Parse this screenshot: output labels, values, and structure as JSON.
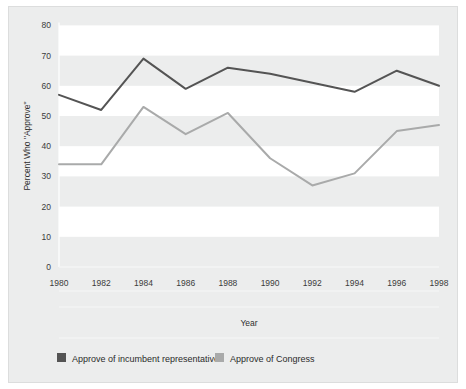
{
  "chart_data": {
    "type": "line",
    "title": "",
    "xlabel": "Year",
    "ylabel": "Percent Who \"Approve\"",
    "x": [
      1980,
      1982,
      1984,
      1986,
      1988,
      1990,
      1992,
      1994,
      1996,
      1998
    ],
    "xticklabels": [
      "1980",
      "1982",
      "1984",
      "1986",
      "1988",
      "1990",
      "1992",
      "1994",
      "1996",
      "1998"
    ],
    "yticklabels": [
      "0",
      "10",
      "20",
      "30",
      "40",
      "50",
      "60",
      "70",
      "80"
    ],
    "yticks": [
      0,
      10,
      20,
      30,
      40,
      50,
      60,
      70,
      80
    ],
    "ylim": [
      0,
      80
    ],
    "xlim": [
      1980,
      1998
    ],
    "grid": false,
    "banded_background": true,
    "legend_position": "bottom",
    "series": [
      {
        "name": "Approve of incumbent representative",
        "color": "#545454",
        "values": [
          57,
          52,
          69,
          59,
          66,
          64,
          61,
          58,
          65,
          60
        ]
      },
      {
        "name": "Approve of Congress",
        "color": "#a9aaaa",
        "values": [
          34,
          34,
          53,
          44,
          51,
          36,
          27,
          31,
          45,
          47
        ]
      }
    ]
  },
  "legend": {
    "items": [
      {
        "label": "Approve of incumbent representative",
        "color": "#545454"
      },
      {
        "label": "Approve of Congress",
        "color": "#a9aaaa"
      }
    ]
  },
  "colors": {
    "plate_background": "#eceded",
    "band_light": "#ffffff",
    "band_shade": "#e6e7e8",
    "axis": "#ffffff",
    "text": "#2e2e2e",
    "series_dark": "#545454",
    "series_light": "#a9aaaa"
  }
}
